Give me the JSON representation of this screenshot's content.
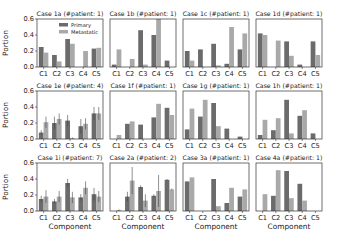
{
  "figure": {
    "legend": {
      "primary_label": "Primary",
      "metastatic_label": "Metastatic"
    },
    "colors": {
      "primary": "#6b6b6b",
      "metastatic": "#a9a9a9",
      "axis": "#333333",
      "errorbar": "#444444"
    },
    "ylabel": "Portion",
    "xlabel": "Component",
    "yticks": [
      "0.0",
      "0.2",
      "0.4",
      "0.6"
    ],
    "xticks": [
      "C1",
      "C2",
      "C3",
      "C4",
      "C5"
    ]
  },
  "chart_data": [
    {
      "type": "bar",
      "title": "Case 1a (#patient: 1)",
      "categories": [
        "C1",
        "C2",
        "C3",
        "C4",
        "C5"
      ],
      "ylim": [
        0,
        0.6
      ],
      "ylabel": "Portion",
      "xlabel": "",
      "legend": [
        "Primary",
        "Metastatic"
      ],
      "legend_position": "upper right",
      "series": [
        {
          "name": "Primary",
          "values": [
            0.25,
            0.15,
            0.35,
            0.0,
            0.23
          ]
        },
        {
          "name": "Metastatic",
          "values": [
            0.18,
            0.07,
            0.29,
            0.2,
            0.24
          ]
        }
      ]
    },
    {
      "type": "bar",
      "title": "Case 1b (#patient: 1)",
      "categories": [
        "C1",
        "C2",
        "C3",
        "C4",
        "C5"
      ],
      "ylim": [
        0,
        0.6
      ],
      "series": [
        {
          "name": "Primary",
          "values": [
            0.03,
            0.0,
            0.46,
            0.4,
            0.08
          ]
        },
        {
          "name": "Metastatic",
          "values": [
            0.22,
            0.1,
            0.03,
            0.6,
            0.0
          ]
        }
      ]
    },
    {
      "type": "bar",
      "title": "Case 1c (#patient: 1)",
      "categories": [
        "C1",
        "C2",
        "C3",
        "C4",
        "C5"
      ],
      "ylim": [
        0,
        0.6
      ],
      "series": [
        {
          "name": "Primary",
          "values": [
            0.2,
            0.22,
            0.29,
            0.04,
            0.22
          ]
        },
        {
          "name": "Metastatic",
          "values": [
            0.08,
            0.0,
            0.02,
            0.5,
            0.42
          ]
        }
      ]
    },
    {
      "type": "bar",
      "title": "Case 1d (#patient: 1)",
      "categories": [
        "C1",
        "C2",
        "C3",
        "C4",
        "C5"
      ],
      "ylim": [
        0,
        0.6
      ],
      "series": [
        {
          "name": "Primary",
          "values": [
            0.42,
            0.0,
            0.32,
            0.03,
            0.32
          ]
        },
        {
          "name": "Metastatic",
          "values": [
            0.4,
            0.33,
            0.14,
            0.0,
            0.15
          ]
        }
      ]
    },
    {
      "type": "bar",
      "title": "Case 1e (#patient: 4)",
      "categories": [
        "C1",
        "C2",
        "C3",
        "C4",
        "C5"
      ],
      "ylim": [
        0,
        0.6
      ],
      "ylabel": "Portion",
      "error_bars": true,
      "series": [
        {
          "name": "Primary",
          "values": [
            0.08,
            0.2,
            0.23,
            0.16,
            0.32
          ],
          "error": [
            0.03,
            0.08,
            0.07,
            0.09,
            0.08
          ]
        },
        {
          "name": "Metastatic",
          "values": [
            0.21,
            0.25,
            0.01,
            0.19,
            0.32
          ],
          "error": [
            0.07,
            0.07,
            0.01,
            0.07,
            0.08
          ]
        }
      ]
    },
    {
      "type": "bar",
      "title": "Case 1f (#patient: 1)",
      "categories": [
        "C1",
        "C2",
        "C3",
        "C4",
        "C5"
      ],
      "ylim": [
        0,
        0.6
      ],
      "series": [
        {
          "name": "Primary",
          "values": [
            0.0,
            0.19,
            0.18,
            0.27,
            0.39
          ]
        },
        {
          "name": "Metastatic",
          "values": [
            0.05,
            0.22,
            0.0,
            0.44,
            0.3
          ]
        }
      ]
    },
    {
      "type": "bar",
      "title": "Case 1g (#patient: 1)",
      "categories": [
        "C1",
        "C2",
        "C3",
        "C4",
        "C5"
      ],
      "ylim": [
        0,
        0.6
      ],
      "series": [
        {
          "name": "Primary",
          "values": [
            0.12,
            0.28,
            0.45,
            0.13,
            0.03
          ]
        },
        {
          "name": "Metastatic",
          "values": [
            0.38,
            0.49,
            0.16,
            0.0,
            0.0
          ]
        }
      ]
    },
    {
      "type": "bar",
      "title": "Case 1h (#patient: 1)",
      "categories": [
        "C1",
        "C2",
        "C3",
        "C4",
        "C5"
      ],
      "ylim": [
        0,
        0.6
      ],
      "series": [
        {
          "name": "Primary",
          "values": [
            0.05,
            0.11,
            0.49,
            0.29,
            0.07
          ]
        },
        {
          "name": "Metastatic",
          "values": [
            0.24,
            0.26,
            0.07,
            0.36,
            0.0
          ]
        }
      ]
    },
    {
      "type": "bar",
      "title": "Case 1i (#patient: 7)",
      "categories": [
        "C1",
        "C2",
        "C3",
        "C4",
        "C5"
      ],
      "ylim": [
        0,
        0.6
      ],
      "ylabel": "Portion",
      "xlabel": "Component",
      "error_bars": true,
      "series": [
        {
          "name": "Primary",
          "values": [
            0.15,
            0.12,
            0.35,
            0.17,
            0.21
          ],
          "error": [
            0.04,
            0.03,
            0.05,
            0.04,
            0.08
          ]
        },
        {
          "name": "Metastatic",
          "values": [
            0.18,
            0.18,
            0.17,
            0.29,
            0.18
          ],
          "error": [
            0.08,
            0.07,
            0.07,
            0.08,
            0.07
          ]
        }
      ]
    },
    {
      "type": "bar",
      "title": "Case 2a (#patient: 2)",
      "categories": [
        "C1",
        "C2",
        "C3",
        "C4",
        "C5"
      ],
      "ylim": [
        0,
        0.6
      ],
      "xlabel": "Component",
      "error_bars": true,
      "series": [
        {
          "name": "Primary",
          "values": [
            0.0,
            0.18,
            0.3,
            0.19,
            0.39
          ],
          "error": [
            0.0,
            0.06,
            0.02,
            0.02,
            0.01
          ]
        },
        {
          "name": "Metastatic",
          "values": [
            0.01,
            0.38,
            0.13,
            0.25,
            0.27
          ],
          "error": [
            0.01,
            0.17,
            0.08,
            0.2,
            0.01
          ]
        }
      ]
    },
    {
      "type": "bar",
      "title": "Case 3a (#patient: 1)",
      "categories": [
        "C1",
        "C2",
        "C3",
        "C4",
        "C5"
      ],
      "ylim": [
        0,
        0.6
      ],
      "xlabel": "Component",
      "series": [
        {
          "name": "Primary",
          "values": [
            0.37,
            0.0,
            0.4,
            0.1,
            0.18
          ]
        },
        {
          "name": "Metastatic",
          "values": [
            0.42,
            0.0,
            0.06,
            0.29,
            0.27
          ]
        }
      ]
    },
    {
      "type": "bar",
      "title": "Case 4a (#patient: 1)",
      "categories": [
        "C1",
        "C2",
        "C3",
        "C4",
        "C5"
      ],
      "ylim": [
        0,
        0.6
      ],
      "xlabel": "Component",
      "series": [
        {
          "name": "Primary",
          "values": [
            0.0,
            0.19,
            0.5,
            0.34,
            0.0
          ]
        },
        {
          "name": "Metastatic",
          "values": [
            0.21,
            0.51,
            0.16,
            0.13,
            0.0
          ]
        }
      ]
    }
  ]
}
